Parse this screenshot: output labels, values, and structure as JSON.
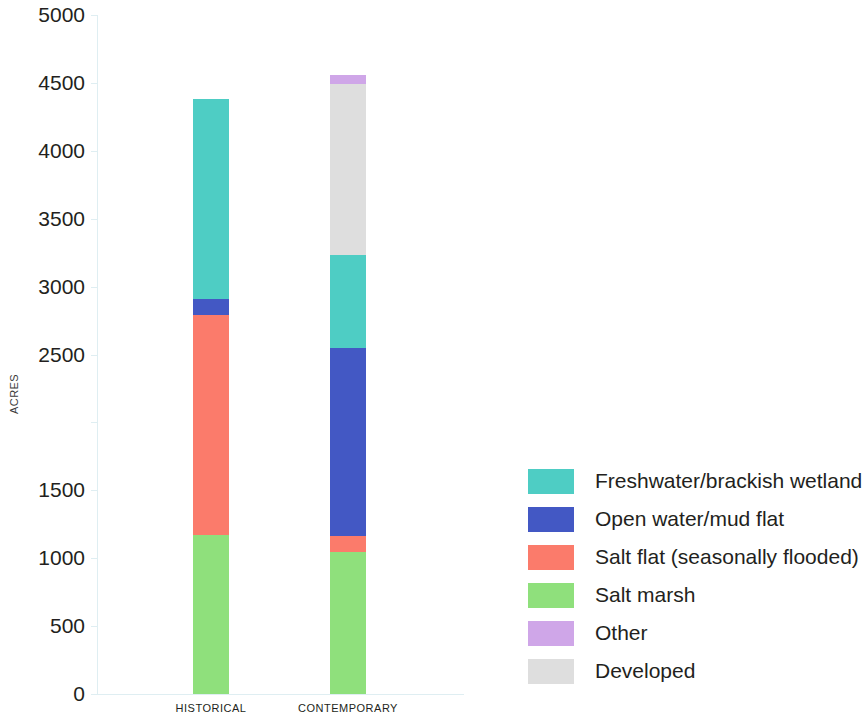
{
  "chart_data": {
    "type": "bar",
    "subtype": "stacked-bar",
    "title": "",
    "xlabel": "",
    "ylabel": "ACRES",
    "ylim": [
      0,
      5000
    ],
    "ytick_values": [
      0,
      500,
      1000,
      1500,
      2000,
      2500,
      3000,
      3500,
      4000,
      4500,
      5000
    ],
    "ytick_labels": [
      "0",
      "500",
      "1000",
      "1500",
      "",
      "2500",
      "3000",
      "3500",
      "4000",
      "4500",
      "5000"
    ],
    "grid": false,
    "legend_position": "right",
    "categories": [
      "HISTORICAL",
      "CONTEMPORARY"
    ],
    "series": [
      {
        "name": "Freshwater/brackish wetland",
        "color": "#4ECDC4",
        "values": [
          1470,
          685
        ]
      },
      {
        "name": "Open water/mud flat",
        "color": "#4358C4",
        "values": [
          120,
          1380
        ]
      },
      {
        "name": "Salt flat (seasonally flooded)",
        "color": "#FB7B6B",
        "values": [
          1620,
          120
        ]
      },
      {
        "name": "Salt marsh",
        "color": "#8FE07C",
        "values": [
          1170,
          1045
        ]
      },
      {
        "name": "Other",
        "color": "#CFA6E8",
        "values": [
          0,
          70
        ]
      },
      {
        "name": "Developed",
        "color": "#DEDEDE",
        "values": [
          0,
          1260
        ]
      }
    ],
    "stack_order_bottom_to_top": [
      "Salt marsh",
      "Salt flat (seasonally flooded)",
      "Open water/mud flat",
      "Freshwater/brackish wetland",
      "Developed",
      "Other"
    ],
    "totals": [
      4380,
      4560
    ]
  },
  "legend": {
    "items": [
      {
        "label": "Freshwater/brackish wetland",
        "color": "#4ECDC4"
      },
      {
        "label": "Open water/mud flat",
        "color": "#4358C4"
      },
      {
        "label": "Salt flat (seasonally flooded)",
        "color": "#FB7B6B"
      },
      {
        "label": "Salt marsh",
        "color": "#8FE07C"
      },
      {
        "label": "Other",
        "color": "#CFA6E8"
      },
      {
        "label": "Developed",
        "color": "#DEDEDE"
      }
    ]
  },
  "axis": {
    "y_title": "ACRES",
    "axis_color": "#dfeef2"
  }
}
